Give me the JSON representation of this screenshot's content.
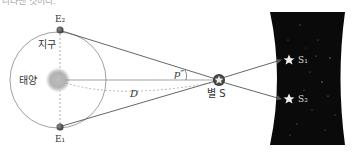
{
  "top_text_fragment": "나타낸 것이다.",
  "labels": {
    "earth_top": "E₂",
    "earth_bottom": "E₁",
    "earth": "지구",
    "sun": "태양",
    "parallax": "p″",
    "distance": "D",
    "star": "별 S",
    "image_1": "S₁",
    "image_2": "S₂"
  },
  "colors": {
    "line": "#555555",
    "orbit": "#888888",
    "background_sky": "#0a0a0a",
    "sun": "#c8c8c8"
  }
}
